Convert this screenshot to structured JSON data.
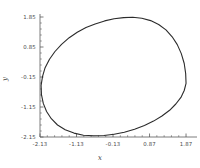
{
  "chart_data": {
    "type": "line",
    "title": "",
    "subtitle": "",
    "xlabel": "x",
    "ylabel": "y",
    "xlim": [
      -2.13,
      2.17
    ],
    "ylim": [
      -2.15,
      1.95
    ],
    "xticks": [
      -2.13,
      -1.13,
      -0.13,
      0.87,
      1.87
    ],
    "xtick_labels": [
      "-2.13",
      "-1.13",
      "-0.13",
      "0.87",
      "1.87"
    ],
    "yticks": [
      -2.15,
      -1.15,
      -0.15,
      0.85,
      1.85
    ],
    "ytick_labels": [
      "-2.15",
      "-1.15",
      "-0.15",
      "0.85",
      "1.85"
    ],
    "grid": false,
    "legend": null,
    "annotations": [],
    "series": [
      {
        "name": "limit-cycle",
        "closed": true,
        "color": "#2b2b2b",
        "linewidth": 1.1,
        "points": [
          [
            1.87,
            -0.36
          ],
          [
            1.86,
            -0.04
          ],
          [
            1.82,
            0.3
          ],
          [
            1.74,
            0.63
          ],
          [
            1.63,
            0.93
          ],
          [
            1.49,
            1.19
          ],
          [
            1.32,
            1.42
          ],
          [
            1.12,
            1.6
          ],
          [
            0.9,
            1.73
          ],
          [
            0.66,
            1.81
          ],
          [
            0.41,
            1.84
          ],
          [
            0.16,
            1.83
          ],
          [
            -0.1,
            1.79
          ],
          [
            -0.36,
            1.72
          ],
          [
            -0.62,
            1.62
          ],
          [
            -0.87,
            1.5
          ],
          [
            -1.11,
            1.34
          ],
          [
            -1.33,
            1.16
          ],
          [
            -1.54,
            0.94
          ],
          [
            -1.72,
            0.7
          ],
          [
            -1.87,
            0.44
          ],
          [
            -1.99,
            0.16
          ],
          [
            -2.06,
            -0.13
          ],
          [
            -2.1,
            -0.43
          ],
          [
            -2.09,
            -0.74
          ],
          [
            -2.04,
            -1.03
          ],
          [
            -1.95,
            -1.3
          ],
          [
            -1.82,
            -1.54
          ],
          [
            -1.65,
            -1.75
          ],
          [
            -1.44,
            -1.91
          ],
          [
            -1.2,
            -2.02
          ],
          [
            -0.94,
            -2.09
          ],
          [
            -0.66,
            -2.11
          ],
          [
            -0.38,
            -2.1
          ],
          [
            -0.1,
            -2.06
          ],
          [
            0.18,
            -1.99
          ],
          [
            0.46,
            -1.89
          ],
          [
            0.73,
            -1.77
          ],
          [
            0.98,
            -1.62
          ],
          [
            1.21,
            -1.45
          ],
          [
            1.42,
            -1.26
          ],
          [
            1.59,
            -1.05
          ],
          [
            1.73,
            -0.83
          ],
          [
            1.82,
            -0.6
          ],
          [
            1.87,
            -0.36
          ]
        ]
      }
    ]
  },
  "axes": {
    "x_title": "x",
    "y_title": "y"
  },
  "colors": {
    "curve": "#2b2b2b",
    "axis": "#5a5a5a",
    "tick_text": "#4a4a4a",
    "background": "#ffffff"
  }
}
